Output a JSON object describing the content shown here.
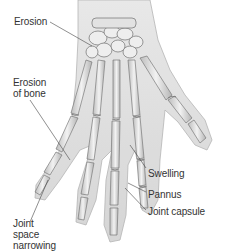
{
  "diagram": {
    "labels": [
      {
        "id": "erosion",
        "text": "Erosion",
        "x": 14,
        "y": 16
      },
      {
        "id": "erosion-of-bone",
        "text": "Erosion\nof bone",
        "x": 13,
        "y": 77
      },
      {
        "id": "swelling",
        "text": "Swelling",
        "x": 148,
        "y": 168
      },
      {
        "id": "pannus",
        "text": "Pannus",
        "x": 148,
        "y": 189
      },
      {
        "id": "joint-capsule",
        "text": "Joint capsule",
        "x": 148,
        "y": 206
      },
      {
        "id": "joint-space-narrowing",
        "text": "Joint\nspace\nnarrowing",
        "x": 13,
        "y": 223
      }
    ],
    "colors": {
      "background": "#ffffff",
      "text": "#333333",
      "leader": "#444444",
      "bone_fill": "#e9e9e9",
      "bone_stroke": "#8a8a8a",
      "soft_tissue": "#d6d6d6"
    }
  }
}
